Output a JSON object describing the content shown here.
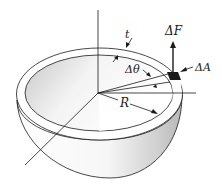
{
  "figure": {
    "labels": {
      "thickness": "t",
      "force": "ΔF",
      "angle": "Δθ",
      "area": "ΔA",
      "radius": "R"
    },
    "colors": {
      "line": "#1a1a1a",
      "shell_shade_light": "#ffffff",
      "shell_shade_dark": "#bdbdbd",
      "area_element": "#1a1a1a"
    }
  }
}
